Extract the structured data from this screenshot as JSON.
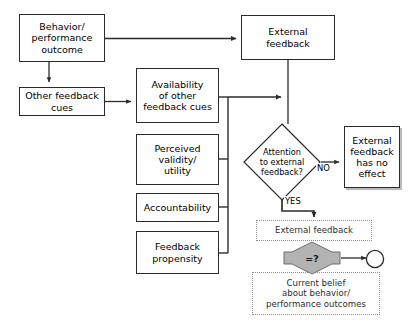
{
  "diagram": {
    "colors": {
      "stroke": "#2b2b2b",
      "dotted_stroke": "#8f8f8f",
      "hex_fill": "#b3b3b3",
      "shadow": "#b9b9b9",
      "background": "#ffffff"
    },
    "nodes": {
      "behavior_outcome": "Behavior/\nperformance\noutcome",
      "other_feedback_cues": "Other feedback\ncues",
      "availability_cues": "Availability\nof other\nfeedback cues",
      "perceived_validity": "Perceived\nvalidity/\nutility",
      "accountability": "Accountability",
      "feedback_propensity": "Feedback\npropensity",
      "external_feedback": "External\nfeedback",
      "attention_decision": "Attention\nto external\nfeedback?",
      "no_effect": "External\nfeedback\nhas no\neffect",
      "external_feedback_dotted": "External feedback",
      "comparison": "=?",
      "current_belief": "Current belief\nabout behavior/\nperformance outcomes"
    },
    "edge_labels": {
      "yes": "YES",
      "no": "NO"
    }
  }
}
